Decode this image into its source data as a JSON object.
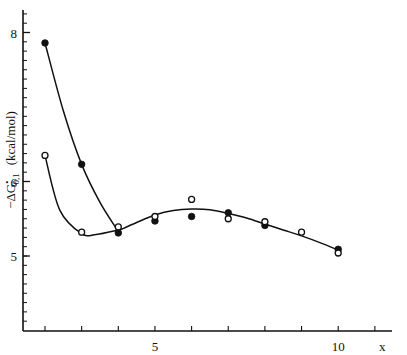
{
  "chart_data": {
    "type": "scatter",
    "title": "",
    "xlabel": "x",
    "ylabel": "−ΔG•0,1 (kcal/mol)",
    "ylabel_parts": {
      "main": "−ΔG",
      "sup": "•",
      "sub": "0,1",
      "unit": "(kcal/mol)"
    },
    "xlim": [
      1,
      12
    ],
    "ylim": [
      4.0,
      8.3
    ],
    "x_ticks": [
      2,
      3,
      4,
      5,
      6,
      7,
      8,
      9,
      10,
      11
    ],
    "x_tick_labels": [
      {
        "value": 5,
        "label": "5"
      },
      {
        "value": 10,
        "label": "10"
      }
    ],
    "y_major_ticks": [
      {
        "value": 5,
        "label": "5"
      },
      {
        "value": 6,
        "label": "6"
      },
      {
        "value": 8,
        "label": "8"
      }
    ],
    "y_minor_step": 0.125,
    "grid": false,
    "legend": null,
    "series": [
      {
        "name": "filled circles",
        "marker": "filled-circle",
        "points": [
          {
            "x": 2,
            "y": 7.86
          },
          {
            "x": 3,
            "y": 6.23
          },
          {
            "x": 4,
            "y": 5.31
          },
          {
            "x": 5,
            "y": 5.47
          },
          {
            "x": 6,
            "y": 5.53
          },
          {
            "x": 7,
            "y": 5.58
          },
          {
            "x": 8,
            "y": 5.41
          },
          {
            "x": 10,
            "y": 5.09
          }
        ]
      },
      {
        "name": "open circles",
        "marker": "open-circle",
        "points": [
          {
            "x": 2,
            "y": 6.35
          },
          {
            "x": 3,
            "y": 5.32
          },
          {
            "x": 4,
            "y": 5.39
          },
          {
            "x": 5,
            "y": 5.53
          },
          {
            "x": 6,
            "y": 5.76
          },
          {
            "x": 7,
            "y": 5.5
          },
          {
            "x": 8,
            "y": 5.46
          },
          {
            "x": 9,
            "y": 5.32
          },
          {
            "x": 10,
            "y": 5.04
          }
        ]
      }
    ],
    "fit_curves": [
      {
        "name": "filled-branch",
        "points": [
          [
            2,
            7.86
          ],
          [
            2.5,
            6.95
          ],
          [
            3,
            6.23
          ],
          [
            3.5,
            5.72
          ],
          [
            4,
            5.33
          ]
        ]
      },
      {
        "name": "open-branch",
        "points": [
          [
            2,
            6.35
          ],
          [
            2.4,
            5.62
          ],
          [
            3,
            5.3
          ],
          [
            3.4,
            5.29
          ],
          [
            4,
            5.35
          ]
        ]
      },
      {
        "name": "common",
        "points": [
          [
            4,
            5.34
          ],
          [
            4.5,
            5.45
          ],
          [
            5,
            5.55
          ],
          [
            5.5,
            5.61
          ],
          [
            6,
            5.63
          ],
          [
            6.5,
            5.62
          ],
          [
            7,
            5.57
          ],
          [
            7.5,
            5.51
          ],
          [
            8,
            5.43
          ],
          [
            8.5,
            5.35
          ],
          [
            9,
            5.27
          ],
          [
            9.5,
            5.18
          ],
          [
            10,
            5.08
          ]
        ]
      }
    ]
  }
}
